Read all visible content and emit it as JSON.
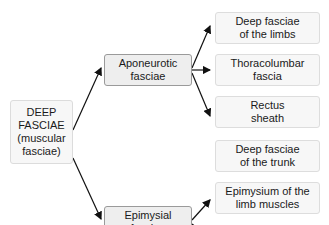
{
  "diagram": {
    "root": {
      "label_lines": [
        "DEEP",
        "FASCIAE",
        "(muscular",
        "fasciae)"
      ]
    },
    "branches": [
      {
        "label_lines": [
          "Aponeurotic",
          "fasciae"
        ],
        "children": [
          {
            "label_lines": [
              "Deep fasciae",
              "of the limbs"
            ]
          },
          {
            "label_lines": [
              "Thoracolumbar",
              "fascia"
            ]
          },
          {
            "label_lines": [
              "Rectus",
              "sheath"
            ]
          }
        ]
      },
      {
        "label_lines": [
          "Epimysial",
          "fasciae"
        ],
        "children": [
          {
            "label_lines": [
              "Deep fasciae",
              "of the trunk"
            ]
          },
          {
            "label_lines": [
              "Epimysium of the",
              "limb muscles"
            ]
          }
        ]
      }
    ],
    "colors": {
      "arrow": "#111111",
      "mid_border": "#9a9a9a",
      "box_fill": "#f7f7f7"
    }
  }
}
